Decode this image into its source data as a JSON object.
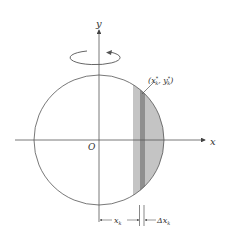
{
  "diagram": {
    "title": "",
    "axes": {
      "x_label": "x",
      "y_label": "y",
      "origin_label": "O"
    },
    "point_label": {
      "open": "(",
      "x": "x",
      "x_sub": "k",
      "x_sup": "*",
      "sep": ", ",
      "y": "y",
      "y_sub": "k",
      "y_sup": "*",
      "close": ")"
    },
    "dimensions": {
      "xk": {
        "var": "x",
        "sub": "k"
      },
      "dxk": {
        "delta": "Δ",
        "var": "x",
        "sub": "k"
      }
    },
    "rotation_arrow": "counterclockwise-about-y-axis",
    "colors": {
      "line": "#555555",
      "strip_fill": "#c4c4c4",
      "strip_dark": "#8f8f8f",
      "background": "#ffffff"
    }
  }
}
